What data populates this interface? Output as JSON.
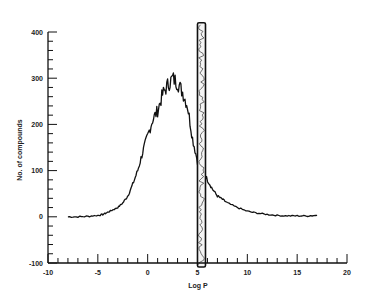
{
  "chart_data": {
    "type": "line",
    "title": "",
    "xlabel": "Log P",
    "ylabel": "No. of compounds",
    "xlim": [
      -10,
      20
    ],
    "ylim": [
      -100,
      400
    ],
    "xticks": [
      -10,
      -5,
      0,
      5,
      10,
      15,
      20
    ],
    "yticks": [
      -100,
      0,
      100,
      200,
      300,
      400
    ],
    "grid": false,
    "legend": null,
    "series": [
      {
        "name": "distribution",
        "x": [
          -8,
          -7,
          -6,
          -5,
          -4.5,
          -4,
          -3.5,
          -3,
          -2.5,
          -2,
          -1.5,
          -1,
          -0.5,
          0,
          0.5,
          1,
          1.5,
          2,
          2.5,
          3,
          3.5,
          4,
          4.5,
          5,
          5.5,
          6,
          6.5,
          7,
          7.5,
          8,
          9,
          10,
          11,
          12,
          13,
          14,
          15,
          16,
          17
        ],
        "y": [
          0,
          0,
          1,
          3,
          5,
          10,
          15,
          20,
          30,
          45,
          70,
          100,
          140,
          175,
          210,
          230,
          265,
          285,
          300,
          290,
          270,
          240,
          170,
          120,
          100,
          80,
          60,
          45,
          38,
          30,
          20,
          12,
          8,
          5,
          3,
          2,
          2,
          2,
          3
        ]
      }
    ],
    "annotations": [
      {
        "type": "vertical_band",
        "x": 5.4,
        "y_range": [
          -100,
          420
        ],
        "description": "dense scribbled vertical band near Log P ≈ 5"
      }
    ]
  }
}
